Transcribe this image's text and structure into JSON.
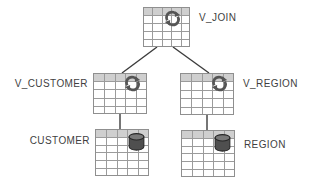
{
  "diagram": {
    "nodes": [
      {
        "id": "V_JOIN",
        "label": "V_JOIN",
        "kind": "view",
        "icon": "refresh-icon",
        "label_side": "right"
      },
      {
        "id": "V_CUSTOMER",
        "label": "V_CUSTOMER",
        "kind": "view",
        "icon": "refresh-icon",
        "label_side": "left"
      },
      {
        "id": "V_REGION",
        "label": "V_REGION",
        "kind": "view",
        "icon": "refresh-icon",
        "label_side": "right"
      },
      {
        "id": "CUSTOMER",
        "label": "CUSTOMER",
        "kind": "table",
        "icon": "database-icon",
        "label_side": "left"
      },
      {
        "id": "REGION",
        "label": "REGION",
        "kind": "table",
        "icon": "database-icon",
        "label_side": "right"
      }
    ],
    "edges": [
      {
        "from": "V_JOIN",
        "to": "V_CUSTOMER"
      },
      {
        "from": "V_JOIN",
        "to": "V_REGION"
      },
      {
        "from": "V_CUSTOMER",
        "to": "CUSTOMER"
      },
      {
        "from": "V_REGION",
        "to": "REGION"
      }
    ],
    "colors": {
      "grid_line": "#9b9b9b",
      "header_fill": "#cfcfcf",
      "icon": "#555555",
      "connector": "#3c3c3c",
      "label_text": "#3f3f3f",
      "background": "#ffffff"
    }
  }
}
